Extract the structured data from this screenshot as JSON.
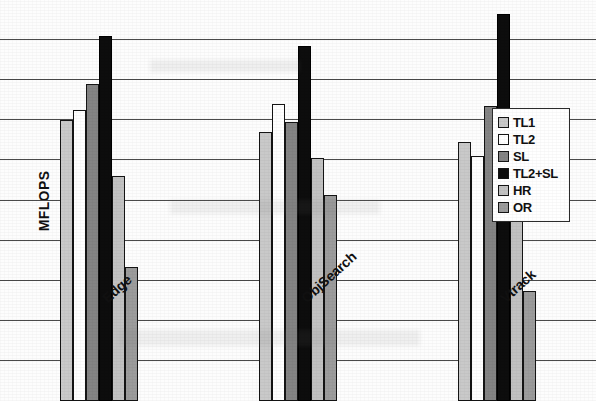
{
  "chart_data": {
    "type": "bar",
    "title": "",
    "xlabel": "",
    "ylabel": "MFLOPS",
    "ylim": [
      0,
      100
    ],
    "yticks": [
      0,
      10,
      20,
      30,
      40,
      50,
      60,
      70,
      80,
      90,
      100
    ],
    "grid": true,
    "legend_position": "right",
    "categories": [
      "Edge",
      "ObjSearch",
      "Vtrack"
    ],
    "series": [
      {
        "name": "TL1",
        "color": "#c9c9c9",
        "values": [
          70.0,
          67.0,
          64.5
        ]
      },
      {
        "name": "TL2",
        "color": "#ffffff",
        "values": [
          72.5,
          74.0,
          61.0
        ]
      },
      {
        "name": "SL",
        "color": "#848484",
        "values": [
          79.0,
          69.5,
          73.5
        ]
      },
      {
        "name": "TL2+SL",
        "color": "#0d0d0d",
        "values": [
          91.0,
          88.5,
          96.5
        ]
      },
      {
        "name": "HR",
        "color": "#c2c2c2",
        "values": [
          56.0,
          60.5,
          58.5
        ]
      },
      {
        "name": "OR",
        "color": "#9c9c9c",
        "values": [
          33.5,
          51.5,
          27.5
        ]
      }
    ]
  },
  "legend": {
    "items": [
      {
        "label": "TL1"
      },
      {
        "label": "TL2"
      },
      {
        "label": "SL"
      },
      {
        "label": "TL2+SL"
      },
      {
        "label": "HR"
      },
      {
        "label": "OR"
      }
    ]
  }
}
